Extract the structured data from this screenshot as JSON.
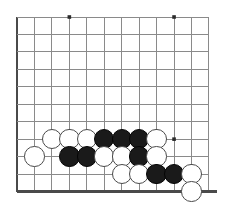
{
  "diagram": {
    "type": "go-board-partial",
    "colors": {
      "background": "#ffffff",
      "grid_line": "#8a8a8a",
      "board_edge": "#4a4a4a",
      "black_stone": "#1a1a1a",
      "white_stone": "#ffffff",
      "white_stone_outline": "#4a4a4a",
      "star_point": "#2b2b2b"
    },
    "geometry": {
      "origin_x": 17,
      "origin_y": 17,
      "spacing": 17.45,
      "cols": 12,
      "rows": 11,
      "stone_radius": 10.2,
      "left_edge_col": 0,
      "bottom_edge_row": 10
    },
    "edges": [
      {
        "name": "left-board-edge",
        "kind": "vertical",
        "index": 0
      },
      {
        "name": "bottom-board-edge",
        "kind": "horizontal",
        "index": 10
      }
    ],
    "star_points": [
      {
        "col": 3,
        "row": 0
      },
      {
        "col": 9,
        "row": 0
      },
      {
        "col": 9,
        "row": 7
      }
    ],
    "stones": [
      {
        "color": "white",
        "col": 2,
        "row": 7
      },
      {
        "color": "white",
        "col": 3,
        "row": 7
      },
      {
        "color": "white",
        "col": 4,
        "row": 7
      },
      {
        "color": "black",
        "col": 5,
        "row": 7
      },
      {
        "color": "black",
        "col": 6,
        "row": 7
      },
      {
        "color": "black",
        "col": 7,
        "row": 7
      },
      {
        "color": "white",
        "col": 8,
        "row": 7
      },
      {
        "color": "white",
        "col": 1,
        "row": 8
      },
      {
        "color": "black",
        "col": 3,
        "row": 8
      },
      {
        "color": "black",
        "col": 4,
        "row": 8
      },
      {
        "color": "white",
        "col": 5,
        "row": 8
      },
      {
        "color": "white",
        "col": 6,
        "row": 8
      },
      {
        "color": "black",
        "col": 7,
        "row": 8
      },
      {
        "color": "white",
        "col": 8,
        "row": 8
      },
      {
        "color": "white",
        "col": 6,
        "row": 9
      },
      {
        "color": "white",
        "col": 7,
        "row": 9
      },
      {
        "color": "black",
        "col": 8,
        "row": 9
      },
      {
        "color": "black",
        "col": 9,
        "row": 9
      },
      {
        "color": "white",
        "col": 10,
        "row": 9
      },
      {
        "color": "white",
        "col": 10,
        "row": 10
      }
    ],
    "counts": {
      "black_stones": 8,
      "white_stones": 12,
      "total_stones": 20
    }
  }
}
